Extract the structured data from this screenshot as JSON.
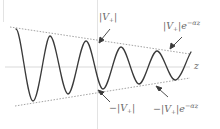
{
  "diagram": {
    "axis": {
      "label": "z"
    },
    "labels": {
      "upper_amplitude": {
        "prefix": "|V",
        "sub": "+",
        "suffix": "|"
      },
      "upper_envelope": {
        "prefix": "|V",
        "sub": "+",
        "suffix": "|e",
        "exp": "−αz"
      },
      "lower_amplitude": {
        "prefix": "−|V",
        "sub": "+",
        "suffix": "|"
      },
      "lower_envelope": {
        "prefix": "−|V",
        "sub": "+",
        "suffix": "|e",
        "exp": "−αz"
      }
    },
    "wave": {
      "peaks": [
        [
          16,
          29
        ],
        [
          50,
          36
        ],
        [
          86,
          41
        ],
        [
          121,
          47
        ],
        [
          157,
          51
        ]
      ],
      "troughs": [
        [
          33,
          101
        ],
        [
          68,
          94
        ],
        [
          103,
          89
        ],
        [
          139,
          84
        ],
        [
          175,
          80
        ]
      ],
      "end": [
        191,
        52
      ]
    },
    "envelope_top": {
      "from": [
        10,
        27
      ],
      "to": [
        190,
        54
      ]
    },
    "envelope_bottom": {
      "from": [
        15,
        106
      ],
      "to": [
        190,
        78
      ]
    },
    "axis_y": 67,
    "colors": {
      "wave": "#3a3a3a",
      "envelope": "#8a8a8a",
      "axis": "#cfcfcf",
      "text": "#6a6a6a"
    }
  }
}
